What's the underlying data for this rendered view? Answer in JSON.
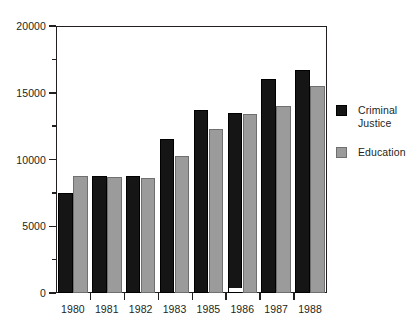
{
  "chart_data": {
    "type": "bar",
    "title": "",
    "subtitle": "",
    "xlabel": "",
    "ylabel": "",
    "categories": [
      "1980",
      "1981",
      "1982",
      "1983",
      "1985",
      "1986",
      "1987",
      "1988"
    ],
    "series": [
      {
        "name": "Criminal Justice",
        "color": "#151515",
        "values": [
          7500,
          8750,
          8800,
          11500,
          13700,
          13500,
          16000,
          16700
        ]
      },
      {
        "name": "Education",
        "color": "#9b9b9b",
        "values": [
          8750,
          8700,
          8600,
          10250,
          12300,
          13400,
          14000,
          15500
        ]
      }
    ],
    "ylim": [
      0,
      20000
    ],
    "y_major_ticks": [
      0,
      5000,
      10000,
      15000,
      20000
    ],
    "y_major_tick_labels": [
      "0",
      "5000",
      "10000",
      "15000",
      "20000"
    ],
    "y_minor_ticks": [
      2500,
      7500,
      12500,
      17500
    ],
    "grid": false,
    "legend_position": "right"
  },
  "legend": {
    "entries": [
      {
        "label": "Criminal\nJustice"
      },
      {
        "label": "Education"
      }
    ]
  },
  "colors": {
    "axis": "#231f20",
    "criminal_justice": "#151515",
    "education": "#9b9b9b",
    "background": "#ffffff"
  }
}
